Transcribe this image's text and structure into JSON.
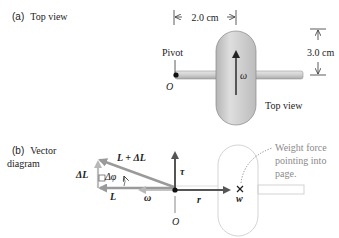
{
  "panel_a": {
    "label_letter": "(a)",
    "label_text": "Top view",
    "dimension_width": "2.0 cm",
    "dimension_height": "3.0 cm",
    "pivot_label": "Pivot",
    "origin_label": "O",
    "omega_label": "ω",
    "top_view_caption": "Top view"
  },
  "panel_b": {
    "label_letter": "(b)",
    "label_line1": "Vector",
    "label_line2": "diagram",
    "vec_L_plus_dL": "L + ΔL",
    "vec_dL": "ΔL",
    "angle_dphi": "Δφ",
    "vec_L": "L",
    "vec_omega": "ω",
    "vec_tau": "τ",
    "vec_r": "r",
    "vec_w": "w",
    "origin_label": "O",
    "weight_note_line1": "Weight force",
    "weight_note_line2": "pointing into",
    "weight_note_line3": "page."
  },
  "colors": {
    "wheel_fill": "#c9c9c9",
    "axle_fill": "#d0d0d0",
    "vector_grey": "#8c8c8c",
    "vector_dark": "#555555",
    "outline_light": "#cfcfcf",
    "text_dark": "#222222",
    "text_grey": "#8a8a8a"
  }
}
